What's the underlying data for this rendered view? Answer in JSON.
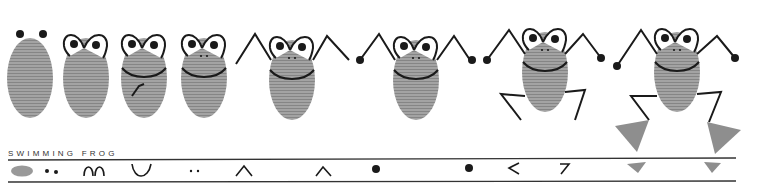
{
  "title": "SWIMMING FROG",
  "colors": {
    "thumb": "#9a9a9a",
    "ink": "#1a1a1a",
    "foot": "#8e8e8e"
  },
  "steps": [
    {
      "index": 1,
      "label": "thumbprint body",
      "symbol": "oval"
    },
    {
      "index": 2,
      "label": "eyes",
      "symbol": "two-dots"
    },
    {
      "index": 3,
      "label": "eye outlines",
      "symbol": "two-arches"
    },
    {
      "index": 4,
      "label": "mouth",
      "symbol": "smile-curve"
    },
    {
      "index": 5,
      "label": "nostrils",
      "symbol": "two-small-dots"
    },
    {
      "index": 6,
      "label": "left arm",
      "symbol": "caret"
    },
    {
      "index": 7,
      "label": "right arm",
      "symbol": "caret"
    },
    {
      "index": 8,
      "label": "left hand",
      "symbol": "dot"
    },
    {
      "index": 9,
      "label": "right hand",
      "symbol": "dot"
    },
    {
      "index": 10,
      "label": "left leg",
      "symbol": "less-than"
    },
    {
      "index": 11,
      "label": "right leg",
      "symbol": "seven"
    },
    {
      "index": 12,
      "label": "left foot",
      "symbol": "triangle"
    },
    {
      "index": 13,
      "label": "right foot",
      "symbol": "triangle"
    }
  ]
}
